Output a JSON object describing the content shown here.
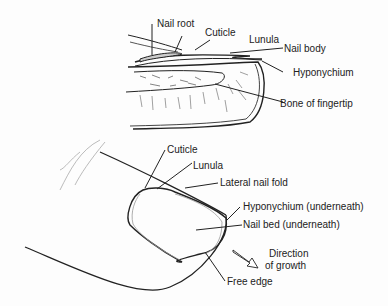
{
  "diagram": {
    "cross_section": {
      "labels": {
        "nail_root": "Nail root",
        "cuticle": "Cuticle",
        "lunula": "Lunula",
        "nail_body": "Nail body",
        "hyponychium": "Hyponychium",
        "bone": "Bone of fingertip"
      }
    },
    "top_view": {
      "labels": {
        "cuticle": "Cuticle",
        "lunula": "Lunula",
        "lateral_nail_fold": "Lateral nail fold",
        "hyponychium": "Hyponychium (underneath)",
        "nail_bed": "Nail bed (underneath)",
        "direction_line1": "Direction",
        "direction_line2": "of growth",
        "free_edge": "Free edge"
      }
    },
    "colors": {
      "ink": "#222222",
      "sketch": "#9a9a9a",
      "background": "#fdfdfd"
    }
  }
}
